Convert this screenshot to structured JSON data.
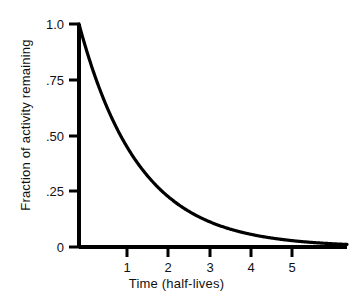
{
  "chart_data": {
    "type": "line",
    "title": "",
    "subtitle": "",
    "xlabel": "Time (half-lives)",
    "ylabel": "Fraction of activity remaining",
    "xlim": [
      0,
      6.45
    ],
    "ylim": [
      0,
      1.0
    ],
    "grid": false,
    "legend": null,
    "annotations": [],
    "x_ticks": [
      {
        "value": 1,
        "label": "1"
      },
      {
        "value": 2,
        "label": "2"
      },
      {
        "value": 3,
        "label": "3"
      },
      {
        "value": 4,
        "label": "4"
      },
      {
        "value": 5,
        "label": "5"
      }
    ],
    "y_ticks": [
      {
        "value": 1.0,
        "label": "1.0"
      },
      {
        "value": 0.75,
        "label": ".75"
      },
      {
        "value": 0.5,
        "label": ".50"
      },
      {
        "value": 0.25,
        "label": ".25"
      },
      {
        "value": 0.0,
        "label": "0"
      }
    ],
    "series": [
      {
        "name": "radioactive decay",
        "formula": "y = 2^(-t)",
        "color": "#000000",
        "x": [
          0,
          0.25,
          0.5,
          0.75,
          1,
          1.25,
          1.5,
          1.75,
          2,
          2.25,
          2.5,
          2.75,
          3,
          3.25,
          3.5,
          3.75,
          4,
          4.25,
          4.5,
          4.75,
          5,
          5.25,
          5.5,
          5.75,
          6,
          6.45
        ],
        "values": [
          1.0,
          0.841,
          0.707,
          0.595,
          0.5,
          0.42,
          0.354,
          0.297,
          0.25,
          0.21,
          0.177,
          0.149,
          0.125,
          0.105,
          0.088,
          0.074,
          0.0625,
          0.053,
          0.044,
          0.037,
          0.031,
          0.026,
          0.022,
          0.019,
          0.016,
          0.011
        ]
      }
    ]
  },
  "axes": {
    "axis_color": "#000000",
    "curve_color": "#000000",
    "background": "#ffffff"
  }
}
